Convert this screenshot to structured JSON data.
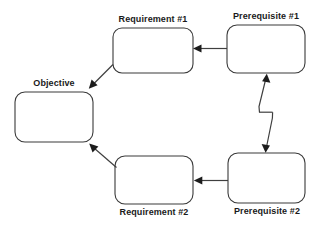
{
  "diagram": {
    "type": "cycle-flow-diagram",
    "background_color": "#ffffff",
    "node_stroke_color": "#3a3a3a",
    "node_fill_color": "#ffffff",
    "edge_color": "#3f3f3f",
    "arrow_color": "#1c1c1c",
    "label_color": "#1a1a1a",
    "nodes": [
      {
        "id": "objective",
        "label": "Objective",
        "label_position": "above",
        "x": 15,
        "y": 92,
        "w": 78,
        "h": 50,
        "r": 10
      },
      {
        "id": "requirement_1",
        "label": "Requirement #1",
        "label_position": "above",
        "x": 113,
        "y": 28,
        "w": 80,
        "h": 45,
        "r": 9
      },
      {
        "id": "prerequisite_1",
        "label": "Prerequisite #1",
        "label_position": "above",
        "x": 227,
        "y": 25,
        "w": 78,
        "h": 48,
        "r": 10
      },
      {
        "id": "requirement_2",
        "label": "Requirement #2",
        "label_position": "below",
        "x": 115,
        "y": 156,
        "w": 78,
        "h": 48,
        "r": 10
      },
      {
        "id": "prerequisite_2",
        "label": "Prerequisite #2",
        "label_position": "below",
        "x": 228,
        "y": 153,
        "w": 77,
        "h": 50,
        "r": 10
      }
    ],
    "edges": [
      {
        "id": "edge-pre1-to-req1",
        "from": "prerequisite_1",
        "to": "requirement_1",
        "style": "straight-horizontal",
        "direction": "leftward"
      },
      {
        "id": "edge-req1-to-objective",
        "from": "requirement_1",
        "to": "objective",
        "style": "diagonal",
        "direction": "down-left"
      },
      {
        "id": "edge-pre2-to-pre1",
        "from": "prerequisite_2",
        "to": "prerequisite_1",
        "style": "zigzag-upward",
        "direction": "upward"
      },
      {
        "id": "edge-pre1-to-pre2",
        "from": "prerequisite_1",
        "to": "prerequisite_2",
        "style": "zigzag-downward",
        "direction": "downward"
      },
      {
        "id": "edge-pre2-to-req2",
        "from": "prerequisite_2",
        "to": "requirement_2",
        "style": "straight-horizontal",
        "direction": "leftward"
      },
      {
        "id": "edge-req2-to-objective",
        "from": "requirement_2",
        "to": "objective",
        "style": "diagonal",
        "direction": "up-left"
      }
    ]
  }
}
